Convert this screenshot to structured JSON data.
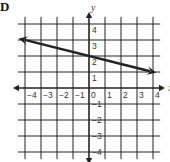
{
  "figure": {
    "label": "D"
  },
  "chart_data": {
    "type": "line",
    "title": "",
    "xlabel": "x",
    "ylabel": "y",
    "xlim": [
      -4.5,
      4.5
    ],
    "ylim": [
      -4.5,
      4.5
    ],
    "grid": true,
    "x_ticks": [
      "-4",
      "-3",
      "-2",
      "-1",
      "0",
      "1",
      "2",
      "3",
      "4"
    ],
    "y_ticks": [
      "4",
      "3",
      "2",
      "1",
      "-1",
      "-2",
      "-3",
      "-4"
    ],
    "x_tick_labels": [
      "−4",
      "−3",
      "−2",
      "−1",
      "0",
      "1",
      "2",
      "3",
      "4"
    ],
    "y_tick_labels": [
      "4",
      "3",
      "2",
      "1",
      "−1",
      "−2",
      "−3",
      "−4"
    ],
    "series": [
      {
        "name": "line",
        "equation": "y = -1/4 x + 2",
        "slope": -0.25,
        "intercept": 2,
        "x": [
          -4.4,
          4.2
        ],
        "y": [
          3.1,
          0.95
        ],
        "arrows": "both",
        "color": "#222222"
      }
    ]
  },
  "colors": {
    "ink": "#222222",
    "background": "#ffffff"
  }
}
